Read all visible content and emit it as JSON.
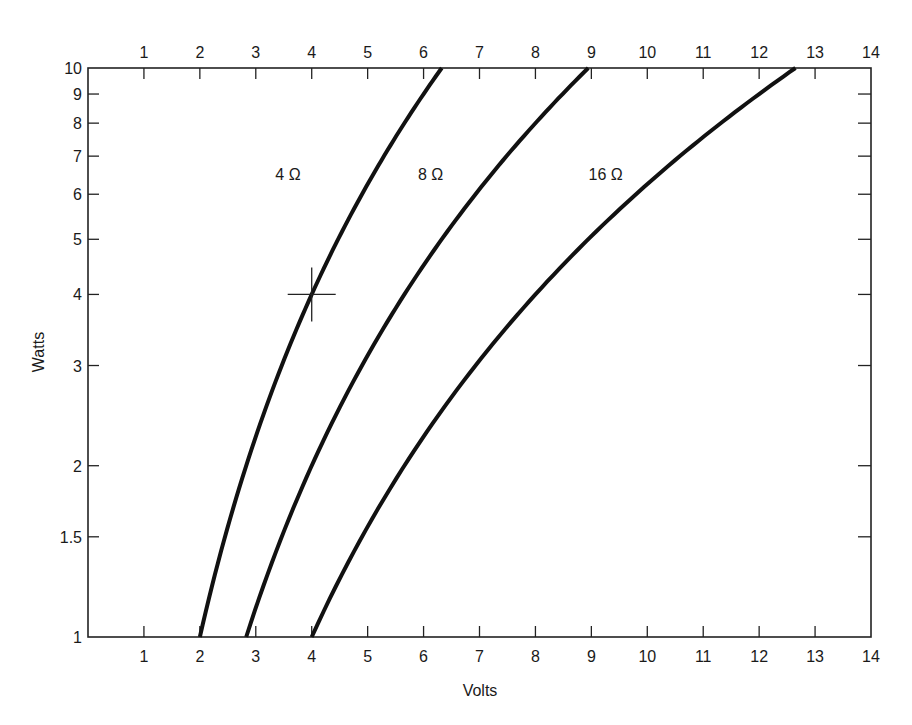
{
  "chart_data": {
    "type": "line",
    "title": "",
    "xlabel": "Volts",
    "ylabel": "Watts",
    "xlim": [
      0,
      14
    ],
    "ylim": [
      1,
      10
    ],
    "yscale": "log",
    "grid": false,
    "x_ticks_bottom": [
      "1",
      "2",
      "3",
      "4",
      "5",
      "6",
      "7",
      "8",
      "9",
      "10",
      "11",
      "12",
      "13",
      "14"
    ],
    "x_ticks_top": [
      "1",
      "2",
      "3",
      "4",
      "5",
      "6",
      "7",
      "8",
      "9",
      "10",
      "11",
      "12",
      "13",
      "14"
    ],
    "y_ticks": [
      {
        "value": 1,
        "label": "1"
      },
      {
        "value": 1.5,
        "label": "1.5"
      },
      {
        "value": 2,
        "label": "2"
      },
      {
        "value": 3,
        "label": "3"
      },
      {
        "value": 4,
        "label": "4"
      },
      {
        "value": 5,
        "label": "5"
      },
      {
        "value": 6,
        "label": "6"
      },
      {
        "value": 7,
        "label": "7"
      },
      {
        "value": 8,
        "label": "8"
      },
      {
        "value": 9,
        "label": "9"
      },
      {
        "value": 10,
        "label": "10"
      }
    ],
    "series": [
      {
        "name": "4 Ω",
        "resistance": 4,
        "label": "4 Ω",
        "x": [
          2.0,
          2.45,
          2.83,
          3.46,
          4.0,
          4.47,
          4.9,
          5.29,
          5.66,
          6.0,
          6.32
        ],
        "y": [
          1.0,
          1.5,
          2.0,
          3.0,
          4.0,
          5.0,
          6.0,
          7.0,
          8.0,
          9.0,
          10.0
        ]
      },
      {
        "name": "8 Ω",
        "resistance": 8,
        "label": "8 Ω",
        "x": [
          2.83,
          3.46,
          4.0,
          4.9,
          5.66,
          6.32,
          6.93,
          7.48,
          8.0,
          8.49,
          8.94
        ],
        "y": [
          1.0,
          1.5,
          2.0,
          3.0,
          4.0,
          5.0,
          6.0,
          7.0,
          8.0,
          9.0,
          10.0
        ]
      },
      {
        "name": "16 Ω",
        "resistance": 16,
        "label": "16 Ω",
        "x": [
          4.0,
          4.9,
          5.66,
          6.93,
          8.0,
          8.94,
          9.8,
          10.58,
          11.31,
          12.0,
          12.65
        ],
        "y": [
          1.0,
          1.5,
          2.0,
          3.0,
          4.0,
          5.0,
          6.0,
          7.0,
          8.0,
          9.0,
          10.0
        ]
      }
    ],
    "annotations": [
      {
        "type": "crosshair",
        "x": 4,
        "y": 4,
        "note": "marker on 4 Ω curve"
      }
    ],
    "label_positions": [
      {
        "series": "4 Ω",
        "x": 3.35,
        "y": 6.5
      },
      {
        "series": "8 Ω",
        "x": 5.9,
        "y": 6.5
      },
      {
        "series": "16 Ω",
        "x": 8.95,
        "y": 6.5
      }
    ]
  },
  "axes": {
    "x_title": "Volts",
    "y_title": "Watts"
  },
  "style": {
    "line_color": "#111111",
    "axis_color": "#222222",
    "background": "#ffffff"
  }
}
